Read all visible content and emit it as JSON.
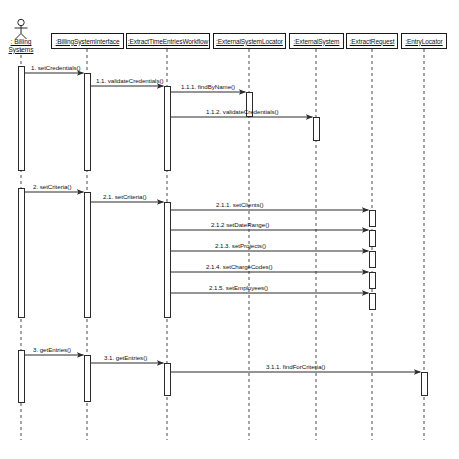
{
  "diagram": {
    "type": "uml-sequence-diagram",
    "title": "",
    "width": 459,
    "height": 459,
    "background": "#ffffff",
    "line_color": "#2b2b2b",
    "text_color": "#111111"
  },
  "actor": {
    "name": "actor-billing-systems",
    "label_line1": ": Billing",
    "label_line2": "Systems",
    "x": 21,
    "label_y": 38
  },
  "lifelines": [
    {
      "id": "billing-system-interface",
      "label": ":BillingSystemInterface",
      "x": 87,
      "box_left": 51,
      "box_top": 33,
      "box_width": 73,
      "box_height": 16
    },
    {
      "id": "extract-time-entries-workflow",
      "label": ":ExtractTimeEntriesWorkflow",
      "x": 167,
      "box_left": 126,
      "box_top": 33,
      "box_width": 84,
      "box_height": 16
    },
    {
      "id": "external-system-locator",
      "label": ":ExternalSystemLocator",
      "x": 249,
      "box_left": 213,
      "box_top": 33,
      "box_width": 73,
      "box_height": 16
    },
    {
      "id": "external-system",
      "label": ":ExternalSystem",
      "x": 316,
      "box_left": 289,
      "box_top": 33,
      "box_width": 55,
      "box_height": 16
    },
    {
      "id": "extract-request",
      "label": ":ExtractRequest",
      "x": 372,
      "box_left": 346,
      "box_top": 33,
      "box_width": 52,
      "box_height": 16
    },
    {
      "id": "entry-locator",
      "label": ":EntryLocator",
      "x": 424,
      "box_left": 401,
      "box_top": 33,
      "box_width": 46,
      "box_height": 16
    }
  ],
  "messages": [
    {
      "id": "msg-1",
      "label": "1. setCredentials()",
      "from_x": 21,
      "to_x": 87,
      "y": 73,
      "label_x": 31,
      "label_y": 64
    },
    {
      "id": "msg-1-1",
      "label": "1.1. validateCredentials()",
      "from_x": 87,
      "to_x": 167,
      "y": 86,
      "label_x": 96,
      "label_y": 77
    },
    {
      "id": "msg-1-1-1",
      "label": "1.1.1. findByName()",
      "from_x": 167,
      "to_x": 249,
      "y": 92,
      "label_x": 181,
      "label_y": 83
    },
    {
      "id": "msg-1-1-2",
      "label": "1.1.2. validateCredentials()",
      "from_x": 167,
      "to_x": 316,
      "y": 117,
      "label_x": 206,
      "label_y": 108
    },
    {
      "id": "msg-2",
      "label": "2. setCriteria()",
      "from_x": 21,
      "to_x": 87,
      "y": 192,
      "label_x": 33,
      "label_y": 183
    },
    {
      "id": "msg-2-1",
      "label": "2.1. setCriteria()",
      "from_x": 87,
      "to_x": 167,
      "y": 202,
      "label_x": 103,
      "label_y": 193
    },
    {
      "id": "msg-2-1-1",
      "label": "2.1.1. setClients()",
      "from_x": 167,
      "to_x": 372,
      "y": 210,
      "label_x": 216,
      "label_y": 201
    },
    {
      "id": "msg-2-1-2",
      "label": "2.1.2 setDateRange()",
      "from_x": 167,
      "to_x": 372,
      "y": 230,
      "label_x": 211,
      "label_y": 221
    },
    {
      "id": "msg-2-1-3",
      "label": "2.1.3. setProjects()",
      "from_x": 167,
      "to_x": 372,
      "y": 251,
      "label_x": 215,
      "label_y": 242
    },
    {
      "id": "msg-2-1-4",
      "label": "2.1.4. setChargeCodes()",
      "from_x": 167,
      "to_x": 372,
      "y": 272,
      "label_x": 206,
      "label_y": 263
    },
    {
      "id": "msg-2-1-5",
      "label": "2.1.5. setEmployees()",
      "from_x": 167,
      "to_x": 372,
      "y": 293,
      "label_x": 209,
      "label_y": 284
    },
    {
      "id": "msg-3",
      "label": "3. getEntries()",
      "from_x": 21,
      "to_x": 87,
      "y": 355,
      "label_x": 33,
      "label_y": 346
    },
    {
      "id": "msg-3-1",
      "label": "3.1. getEntries()",
      "from_x": 87,
      "to_x": 167,
      "y": 363,
      "label_x": 104,
      "label_y": 354
    },
    {
      "id": "msg-3-1-1",
      "label": "3.1.1. findForCriteria()",
      "from_x": 167,
      "to_x": 424,
      "y": 372,
      "label_x": 266,
      "label_y": 363
    }
  ],
  "activations": [
    {
      "id": "act-actor-1",
      "x": 21,
      "top": 66,
      "height": 105,
      "width": 7
    },
    {
      "id": "act-interface-1",
      "x": 87,
      "top": 73,
      "height": 98,
      "width": 7
    },
    {
      "id": "act-workflow-1",
      "x": 167,
      "top": 86,
      "height": 85,
      "width": 7
    },
    {
      "id": "act-locator-1",
      "x": 249,
      "top": 92,
      "height": 25,
      "width": 7
    },
    {
      "id": "act-external-1",
      "x": 316,
      "top": 117,
      "height": 24,
      "width": 7
    },
    {
      "id": "act-actor-2",
      "x": 21,
      "top": 188,
      "height": 130,
      "width": 7
    },
    {
      "id": "act-interface-2",
      "x": 87,
      "top": 192,
      "height": 126,
      "width": 7
    },
    {
      "id": "act-workflow-2",
      "x": 167,
      "top": 202,
      "height": 116,
      "width": 7
    },
    {
      "id": "act-request-1",
      "x": 372,
      "top": 210,
      "height": 17,
      "width": 7
    },
    {
      "id": "act-request-2",
      "x": 372,
      "top": 230,
      "height": 17,
      "width": 7
    },
    {
      "id": "act-request-3",
      "x": 372,
      "top": 251,
      "height": 17,
      "width": 7
    },
    {
      "id": "act-request-4",
      "x": 372,
      "top": 272,
      "height": 17,
      "width": 7
    },
    {
      "id": "act-request-5",
      "x": 372,
      "top": 293,
      "height": 17,
      "width": 7
    },
    {
      "id": "act-actor-3",
      "x": 21,
      "top": 350,
      "height": 53,
      "width": 7
    },
    {
      "id": "act-interface-3",
      "x": 87,
      "top": 355,
      "height": 47,
      "width": 7
    },
    {
      "id": "act-workflow-3",
      "x": 167,
      "top": 363,
      "height": 33,
      "width": 7
    },
    {
      "id": "act-entrylocator-1",
      "x": 424,
      "top": 372,
      "height": 24,
      "width": 7
    }
  ],
  "lifeline_extent": {
    "top": 49,
    "bottom": 440
  }
}
